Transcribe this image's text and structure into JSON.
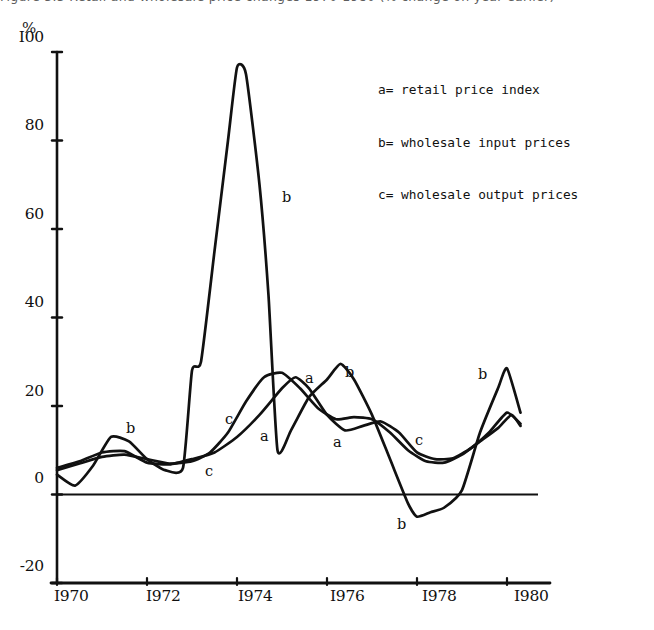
{
  "figure": {
    "caption": "Figure 3.3    Retail and wholesale price changes 1970-1980 (% change on year earlier)"
  },
  "legend": {
    "entries": [
      "a= retail price index",
      "b= wholesale input prices",
      "c= wholesale output prices"
    ]
  },
  "axis": {
    "y_unit_label": "%",
    "y_tick_labels": [
      "I00",
      "80",
      "60",
      "40",
      "20",
      "0",
      "-20"
    ],
    "x_tick_labels": [
      "I970",
      "I972",
      "I974",
      "I976",
      "I978",
      "I980"
    ]
  },
  "annotations": [
    {
      "text": "b",
      "x": 126,
      "y": 420
    },
    {
      "text": "b",
      "x": 282,
      "y": 189
    },
    {
      "text": "c",
      "x": 225,
      "y": 411
    },
    {
      "text": "a",
      "x": 260,
      "y": 428
    },
    {
      "text": "c",
      "x": 205,
      "y": 463
    },
    {
      "text": "a",
      "x": 305,
      "y": 370
    },
    {
      "text": "b",
      "x": 345,
      "y": 364
    },
    {
      "text": "a",
      "x": 333,
      "y": 434
    },
    {
      "text": "c",
      "x": 415,
      "y": 432
    },
    {
      "text": "b",
      "x": 397,
      "y": 516
    },
    {
      "text": "b",
      "x": 478,
      "y": 366
    }
  ],
  "colors": {
    "ink": "#111111",
    "background": "#ffffff"
  },
  "chart_data": {
    "type": "line",
    "title": "Retail and wholesale price changes 1970-1980",
    "xlabel": "",
    "ylabel": "%",
    "xlim": [
      1970,
      1980.6
    ],
    "ylim": [
      -20,
      100
    ],
    "grid": false,
    "legend_position": "top-right",
    "x_ticks": [
      1970,
      1972,
      1974,
      1976,
      1978,
      1980
    ],
    "y_ticks": [
      -20,
      0,
      20,
      40,
      60,
      80,
      100
    ],
    "series": [
      {
        "name": "a",
        "label": "retail price index",
        "x": [
          1970.0,
          1970.5,
          1971.0,
          1971.5,
          1972.0,
          1972.5,
          1973.0,
          1973.5,
          1974.0,
          1974.5,
          1975.0,
          1975.3,
          1975.6,
          1976.0,
          1976.4,
          1976.8,
          1977.2,
          1977.6,
          1978.0,
          1978.4,
          1978.8,
          1979.2,
          1979.6,
          1980.0,
          1980.3
        ],
        "y": [
          6.0,
          7.5,
          9.5,
          9.8,
          7.2,
          6.8,
          8.0,
          9.5,
          13.0,
          18.0,
          24.0,
          26.5,
          24.0,
          18.0,
          14.5,
          15.5,
          16.5,
          14.0,
          9.5,
          8.0,
          8.2,
          10.5,
          14.0,
          18.5,
          16.0
        ]
      },
      {
        "name": "b",
        "label": "wholesale input prices",
        "x": [
          1970.0,
          1970.4,
          1970.8,
          1971.2,
          1971.6,
          1972.0,
          1972.4,
          1972.8,
          1973.0,
          1973.2,
          1973.5,
          1973.8,
          1974.0,
          1974.2,
          1974.5,
          1974.7,
          1974.9,
          1975.2,
          1975.6,
          1976.0,
          1976.3,
          1976.6,
          1977.0,
          1977.4,
          1977.8,
          1978.0,
          1978.3,
          1978.6,
          1979.0,
          1979.4,
          1979.8,
          1980.0,
          1980.3
        ],
        "y": [
          4.5,
          2.0,
          6.5,
          13.0,
          12.0,
          8.0,
          5.5,
          6.0,
          28.0,
          30.0,
          55.0,
          80.0,
          96.5,
          95.0,
          70.0,
          45.0,
          10.0,
          14.5,
          22.0,
          26.0,
          29.5,
          26.0,
          18.0,
          8.0,
          -2.0,
          -5.0,
          -4.0,
          -3.0,
          1.0,
          14.0,
          24.0,
          28.5,
          18.5
        ]
      },
      {
        "name": "c",
        "label": "wholesale output prices",
        "x": [
          1970.0,
          1970.5,
          1971.0,
          1971.5,
          1972.0,
          1972.5,
          1973.0,
          1973.4,
          1973.8,
          1974.2,
          1974.6,
          1975.0,
          1975.4,
          1975.8,
          1976.2,
          1976.6,
          1977.0,
          1977.4,
          1977.8,
          1978.2,
          1978.6,
          1979.0,
          1979.4,
          1979.8,
          1980.1,
          1980.3
        ],
        "y": [
          5.5,
          7.0,
          8.5,
          9.0,
          8.0,
          7.0,
          7.5,
          9.5,
          14.0,
          21.0,
          26.5,
          27.5,
          24.0,
          19.5,
          17.0,
          17.5,
          17.0,
          14.0,
          10.0,
          7.5,
          7.2,
          9.0,
          12.0,
          15.0,
          18.0,
          15.5
        ]
      }
    ]
  }
}
